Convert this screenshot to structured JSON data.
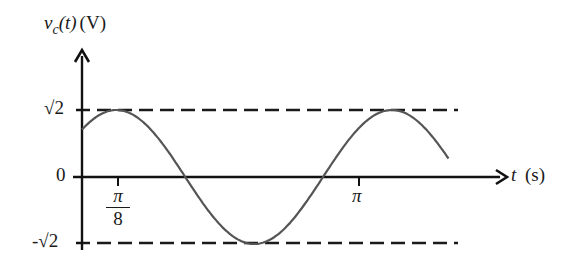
{
  "chart_data": {
    "type": "line",
    "title": "",
    "ylabel": "v_c(t) (V)",
    "ylabel_parts": {
      "var": "v",
      "sub": "c",
      "arg": "(t)",
      "unit": "(V)"
    },
    "xlabel": "t (s)",
    "xlabel_parts": {
      "var": "t",
      "unit": "(s)"
    },
    "function": "sqrt(2)*cos(2t - pi/4)",
    "amplitude": 1.41421356,
    "angular_frequency": 2,
    "phase": -0.78539816,
    "x_range": [
      0,
      4.18
    ],
    "ylim": [
      -1.41421356,
      1.41421356
    ],
    "x_ticks": [
      {
        "value": 0.39269908,
        "label": "π/8",
        "label_num": "π",
        "label_den": "8"
      },
      {
        "value": 3.14159265,
        "label": "π"
      }
    ],
    "y_ticks": [
      {
        "value": 1.41421356,
        "label": "√2"
      },
      {
        "value": 0,
        "label": "0"
      },
      {
        "value": -1.41421356,
        "label": "-√2"
      }
    ],
    "reference_lines": [
      {
        "y": 1.41421356,
        "style": "dashed"
      },
      {
        "y": -1.41421356,
        "style": "dashed"
      }
    ],
    "key_points": [
      {
        "t": 0,
        "v": 1.0
      },
      {
        "t": 0.39269908,
        "v": 1.41421356,
        "note": "maximum"
      },
      {
        "t": 1.17809725,
        "v": 0
      },
      {
        "t": 1.96349541,
        "v": -1.41421356,
        "note": "minimum"
      },
      {
        "t": 2.74889357,
        "v": 0
      },
      {
        "t": 3.53429174,
        "v": 1.41421356,
        "note": "maximum"
      },
      {
        "t": 4.18,
        "v": 0.68
      }
    ],
    "grid": false,
    "legend": null
  },
  "labels": {
    "y_var": "v",
    "y_sub": "c",
    "y_arg": "(t)",
    "y_unit": "(V)",
    "x_var": "t",
    "x_unit": "(s)",
    "tick_sqrt2": "√2",
    "tick_zero": "0",
    "tick_neg_sqrt2": "-√2",
    "tick_pi_over_8_num": "π",
    "tick_pi_over_8_den": "8",
    "tick_pi": "π"
  },
  "colors": {
    "axis": "#111111",
    "curve": "#555555",
    "dashed": "#1a1a1a",
    "text": "#1a1a1a"
  }
}
